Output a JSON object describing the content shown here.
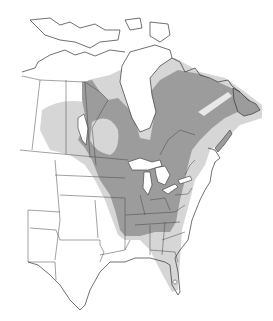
{
  "map": {
    "type": "species range map",
    "region": "North America (Canada, United States)",
    "colors": {
      "background": "#ffffff",
      "outside_range": "#ffffff",
      "light_range": "#d6d6d6",
      "dark_range": "#9c9c9c",
      "water": "#ffffff",
      "border": "#333333"
    },
    "zones": [
      {
        "name": "light-gray-zone",
        "description": "Peripheral range: prairies, Great Plains fringe, Labrador coast, Gulf Coast states"
      },
      {
        "name": "dark-gray-zone",
        "description": "Core range: boreal Canada around Hudson Bay, Quebec, Great Lakes, Midwest, eastern US, Newfoundland"
      }
    ]
  }
}
